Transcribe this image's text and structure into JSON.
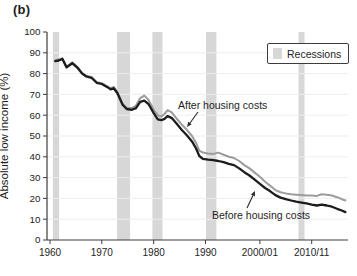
{
  "figure": {
    "panel_label": "(b)"
  },
  "legend": {
    "label": "Recessions",
    "swatch_color": "#d7d7d7"
  },
  "annotations": {
    "after_label": "After housing costs",
    "before_label": "Before housing costs"
  },
  "colors": {
    "after_line": "#9c9c9c",
    "before_line": "#1c1c1c",
    "recession_band": "#d7d7d7",
    "axis": "#3c3c3c",
    "gridline": "#ededed",
    "text": "#1e1e1e"
  },
  "chart_data": {
    "type": "line",
    "title": "",
    "xlabel": "",
    "ylabel": "Absolute low income (%)",
    "ylim": [
      0,
      100
    ],
    "yticks": [
      0,
      10,
      20,
      30,
      40,
      50,
      60,
      70,
      80,
      90,
      100
    ],
    "xlim_years": [
      1960,
      2017.5
    ],
    "xticks": [
      {
        "year": 1960,
        "label": "1960"
      },
      {
        "year": 1970,
        "label": "1970"
      },
      {
        "year": 1980,
        "label": "1980"
      },
      {
        "year": 1990,
        "label": "1990"
      },
      {
        "year": 2000.5,
        "label": "2000/01"
      },
      {
        "year": 2010.5,
        "label": "2010/11"
      }
    ],
    "grid": "horizontal-faint",
    "legend_position": "top-right",
    "recession_bands_years": [
      [
        1960.55,
        1961.75
      ],
      [
        1972.95,
        1975.45
      ],
      [
        1979.75,
        1981.7
      ],
      [
        1990.1,
        1992.1
      ],
      [
        2007.95,
        2009.1
      ]
    ],
    "series": [
      {
        "name": "After housing costs",
        "color": "#9c9c9c",
        "points": [
          [
            1961,
            86.4
          ],
          [
            1961.7,
            86.8
          ],
          [
            1962.4,
            87.4
          ],
          [
            1963.2,
            83.4
          ],
          [
            1964.3,
            85.4
          ],
          [
            1965.3,
            83.2
          ],
          [
            1966.2,
            80.4
          ],
          [
            1967,
            79
          ],
          [
            1968,
            78.4
          ],
          [
            1969,
            76
          ],
          [
            1970,
            75.4
          ],
          [
            1971,
            74
          ],
          [
            1971.7,
            73
          ],
          [
            1972.3,
            73.6
          ],
          [
            1973,
            71.2
          ],
          [
            1974,
            65.6
          ],
          [
            1974.8,
            63.6
          ],
          [
            1975.8,
            63.4
          ],
          [
            1976.6,
            64.6
          ],
          [
            1977.4,
            68.2
          ],
          [
            1978.2,
            69.4
          ],
          [
            1979,
            67.4
          ],
          [
            1980,
            62.6
          ],
          [
            1980.8,
            60
          ],
          [
            1981.5,
            59.4
          ],
          [
            1982.1,
            60.6
          ],
          [
            1982.7,
            62.4
          ],
          [
            1983.5,
            61.4
          ],
          [
            1984.4,
            58.4
          ],
          [
            1985.4,
            55.6
          ],
          [
            1986.4,
            53
          ],
          [
            1987.4,
            50
          ],
          [
            1988.2,
            46.6
          ],
          [
            1988.8,
            43
          ],
          [
            1989.5,
            42
          ],
          [
            1990.5,
            41.6
          ],
          [
            1991.5,
            41.4
          ],
          [
            1992.5,
            42
          ],
          [
            1993.5,
            41
          ],
          [
            1994.5,
            40
          ],
          [
            1995.5,
            39.4
          ],
          [
            1996.5,
            38
          ],
          [
            1997.5,
            36
          ],
          [
            1998.5,
            34.4
          ],
          [
            1999.5,
            32.4
          ],
          [
            2000.5,
            30.4
          ],
          [
            2001.5,
            28
          ],
          [
            2002.5,
            26
          ],
          [
            2003.5,
            24
          ],
          [
            2004.5,
            23
          ],
          [
            2005.5,
            22.4
          ],
          [
            2006.5,
            22
          ],
          [
            2007.5,
            21.8
          ],
          [
            2008.5,
            21.6
          ],
          [
            2009.5,
            21.4
          ],
          [
            2010.5,
            21.4
          ],
          [
            2011.5,
            21.2
          ],
          [
            2012.4,
            22
          ],
          [
            2013.4,
            21.8
          ],
          [
            2014.4,
            21.4
          ],
          [
            2015.4,
            20.6
          ],
          [
            2016.3,
            19.6
          ],
          [
            2017,
            19
          ]
        ]
      },
      {
        "name": "Before housing costs",
        "color": "#1c1c1c",
        "points": [
          [
            1961,
            86
          ],
          [
            1961.7,
            86.3
          ],
          [
            1962.4,
            87
          ],
          [
            1963.2,
            83
          ],
          [
            1964.3,
            85
          ],
          [
            1965.3,
            82.8
          ],
          [
            1966.2,
            80
          ],
          [
            1967,
            78.6
          ],
          [
            1968,
            78
          ],
          [
            1969,
            75.6
          ],
          [
            1970,
            75
          ],
          [
            1971,
            73.6
          ],
          [
            1971.7,
            72.4
          ],
          [
            1972.3,
            73
          ],
          [
            1973,
            70.6
          ],
          [
            1974,
            65
          ],
          [
            1974.8,
            63
          ],
          [
            1975.8,
            62.6
          ],
          [
            1976.6,
            63.4
          ],
          [
            1977.4,
            66.4
          ],
          [
            1978.2,
            67
          ],
          [
            1979,
            65.4
          ],
          [
            1980,
            61
          ],
          [
            1980.8,
            58
          ],
          [
            1981.5,
            57.6
          ],
          [
            1982.1,
            58.2
          ],
          [
            1982.7,
            59.6
          ],
          [
            1983.5,
            58.6
          ],
          [
            1984.4,
            56
          ],
          [
            1985.4,
            53
          ],
          [
            1986.4,
            50.4
          ],
          [
            1987.4,
            47.4
          ],
          [
            1988.2,
            44
          ],
          [
            1988.8,
            40.4
          ],
          [
            1989.5,
            39
          ],
          [
            1990.5,
            38.6
          ],
          [
            1991.5,
            38.4
          ],
          [
            1992.5,
            38
          ],
          [
            1993.5,
            37.4
          ],
          [
            1994.5,
            36.6
          ],
          [
            1995.5,
            36
          ],
          [
            1996.5,
            34.4
          ],
          [
            1997.5,
            32.6
          ],
          [
            1998.5,
            31
          ],
          [
            1999.5,
            29
          ],
          [
            2000.5,
            27
          ],
          [
            2001.5,
            25
          ],
          [
            2002.5,
            23.4
          ],
          [
            2003.5,
            21.6
          ],
          [
            2004.5,
            20.4
          ],
          [
            2005.5,
            19.6
          ],
          [
            2006.5,
            19
          ],
          [
            2007.5,
            18.4
          ],
          [
            2008.5,
            18
          ],
          [
            2009.5,
            17.6
          ],
          [
            2010.5,
            17
          ],
          [
            2011.5,
            16.6
          ],
          [
            2012.4,
            17
          ],
          [
            2013.4,
            16.6
          ],
          [
            2014.4,
            16
          ],
          [
            2015.4,
            15
          ],
          [
            2016.3,
            14.2
          ],
          [
            2017,
            13.4
          ]
        ]
      }
    ]
  }
}
